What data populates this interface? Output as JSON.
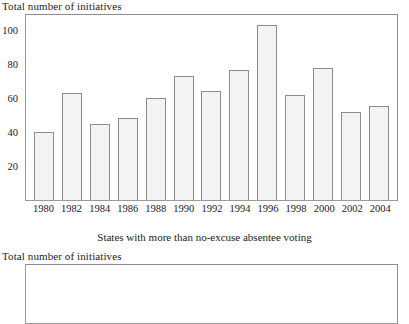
{
  "figure": {
    "chart_one": {
      "y_axis_title": "Total number of initiatives",
      "caption": "States with more than no-excuse absentee voting"
    },
    "chart_two": {
      "y_axis_title": "Total number of initiatives"
    }
  },
  "chart_data": {
    "type": "bar",
    "title": "",
    "subtitle": "",
    "xlabel": "",
    "ylabel": "Total number of initiatives",
    "caption": "States with more than no-excuse absentee voting",
    "categories": [
      "1980",
      "1982",
      "1984",
      "1986",
      "1988",
      "1990",
      "1992",
      "1994",
      "1996",
      "1998",
      "2000",
      "2002",
      "2004"
    ],
    "values": [
      40,
      63,
      45,
      48,
      60,
      73,
      64,
      76.5,
      103,
      61.5,
      77.5,
      52,
      55.5
    ],
    "ylim": [
      0,
      110
    ],
    "yticks": [
      20,
      40,
      60,
      80,
      100
    ],
    "ytick_labels": [
      "20",
      "40",
      "60",
      "80",
      "100"
    ],
    "grid": false,
    "legend": "none",
    "bar_fill": "#f3f3f3",
    "bar_border": "#8c8c8c",
    "frame_color": "#9a9a9a"
  }
}
